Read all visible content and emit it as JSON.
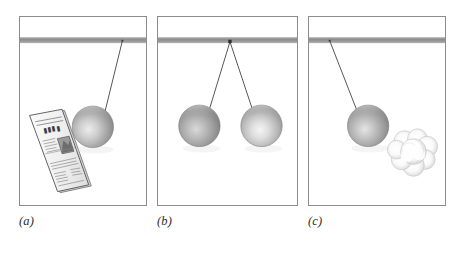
{
  "figure": {
    "background_color": "#ffffff",
    "width": 464,
    "height": 253,
    "panel_border_color": "#8c8c8c",
    "support_bar_color": "#8f8f8f",
    "cord_color": "#4a4a4a",
    "ball_color_mid": "#a9a9a9",
    "ball_color_shadow": "#6e6e6e",
    "ball_highlight": "#e8e8e8"
  },
  "panels": [
    {
      "id": "a",
      "label": "(a)",
      "caption_text": "(a)",
      "description": "Pendulum ball swung aside, suspended by a single cord from the ceiling bar, next to a folded newspaper",
      "support_bar": {
        "present": true,
        "y": 21,
        "thickness": 5
      },
      "cords": [
        {
          "from_x": 104,
          "from_y": 24,
          "to_x": 85,
          "to_y": 100
        }
      ],
      "balls": [
        {
          "cx": 74,
          "cy": 111,
          "r": 21,
          "shade": "standard"
        }
      ],
      "objects": [
        {
          "type": "newspaper",
          "cx": 43,
          "cy": 135,
          "rotation": -22,
          "width": 34,
          "height": 84
        }
      ]
    },
    {
      "id": "b",
      "label": "(b)",
      "caption_text": "(b)",
      "description": "Two pendulum balls hanging side by side from a common attachment point on the ceiling bar, forming a V of cords",
      "support_bar": {
        "present": true,
        "y": 21,
        "thickness": 5
      },
      "cords": [
        {
          "from_x": 73,
          "from_y": 24,
          "to_x": 50,
          "to_y": 96
        },
        {
          "from_x": 73,
          "from_y": 24,
          "to_x": 98,
          "to_y": 96
        }
      ],
      "balls": [
        {
          "cx": 42,
          "cy": 110,
          "r": 21,
          "shade": "dark"
        },
        {
          "cx": 105,
          "cy": 110,
          "r": 21,
          "shade": "light"
        }
      ],
      "objects": []
    },
    {
      "id": "c",
      "label": "(c)",
      "caption_text": "(c)",
      "description": "Pendulum ball suspended by a cord, beside a soft fluffy puff of cotton or cloud",
      "support_bar": {
        "present": true,
        "y": 21,
        "thickness": 5
      },
      "cords": [
        {
          "from_x": 21,
          "from_y": 24,
          "to_x": 49,
          "to_y": 96
        }
      ],
      "balls": [
        {
          "cx": 60,
          "cy": 110,
          "r": 21,
          "shade": "standard"
        }
      ],
      "objects": [
        {
          "type": "puff-cloud",
          "cx": 105,
          "cy": 135,
          "r": 24
        }
      ]
    }
  ],
  "labels": {
    "a": "(a)",
    "b": "(b)",
    "c": "(c)"
  }
}
